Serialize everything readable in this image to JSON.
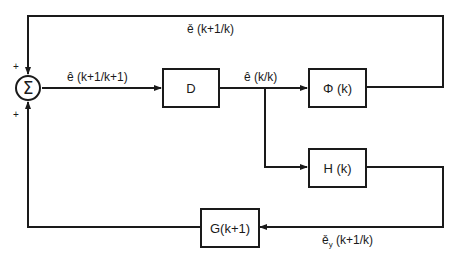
{
  "diagram": {
    "type": "block-diagram",
    "summing_junction": {
      "symbol": "Σ",
      "input_signs": [
        "+",
        "+"
      ]
    },
    "blocks": {
      "d": "D",
      "phi": "Φ (k)",
      "h": "H (k)",
      "g": "G(k+1)"
    },
    "signals": {
      "feedback_top": "ě (k+1/k)",
      "sum_output": "ê (k+1/k+1)",
      "d_output": "ê (k/k)",
      "h_output_base": "ě",
      "h_output_sub": "y",
      "h_output_rest": " (k+1/k)"
    },
    "colors": {
      "line": "#1a1a1a",
      "background": "#ffffff"
    }
  }
}
